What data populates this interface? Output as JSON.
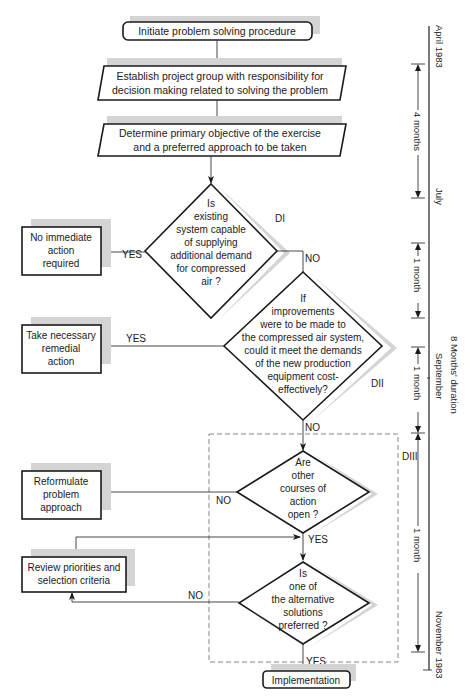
{
  "flowchart": {
    "start": "Initiate problem solving procedure",
    "step1": [
      "Establish project group with responsibility for",
      "decision making related to solving the problem"
    ],
    "step2": [
      "Determine primary objective of the exercise",
      "and a preferred approach to be taken"
    ],
    "decision1": {
      "id": "DI",
      "lines": [
        "Is",
        "existing",
        "system capable",
        "of supplying",
        "additional demand",
        "for compressed",
        "air ?"
      ],
      "yes_label": "YES",
      "no_label": "NO",
      "yes_outcome": [
        "No immediate",
        "action",
        "required"
      ]
    },
    "decision2": {
      "id": "DII",
      "lines": [
        "If",
        "improvements",
        "were to be made to",
        "the compressed air system,",
        "could it meet the demands",
        "of the new production",
        "equipment cost-",
        "effectively?"
      ],
      "yes_label": "YES",
      "no_label": "NO",
      "yes_outcome": [
        "Take necessary",
        "remedial",
        "action"
      ]
    },
    "decision3": {
      "id": "DIII",
      "lines": [
        "Are",
        "other",
        "courses of",
        "action",
        "open ?"
      ],
      "yes_label": "YES",
      "no_label": "NO",
      "no_outcome": [
        "Reformulate",
        "problem",
        "approach"
      ]
    },
    "decision4": {
      "lines": [
        "Is",
        "one of",
        "the alternative",
        "solutions",
        "preferred ?"
      ],
      "yes_label": "YES",
      "no_label": "NO",
      "no_outcome": [
        "Review priorities and",
        "selection criteria"
      ]
    },
    "end": "Implementation"
  },
  "timeline": {
    "start_date": "April 1983",
    "july": "July",
    "september": "September",
    "end_date": "November 1983",
    "total_duration": "8 Months' duration",
    "intervals": [
      "4 months",
      "1 month",
      "1 month",
      "1 month"
    ]
  }
}
